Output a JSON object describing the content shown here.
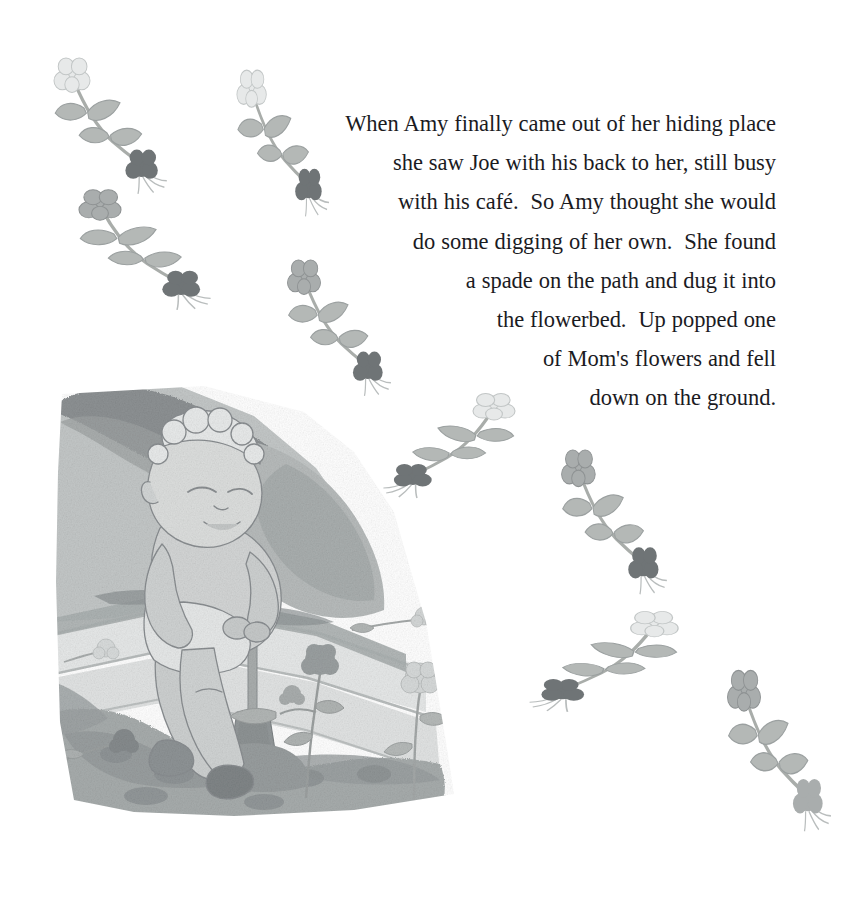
{
  "page": {
    "kind": "childrens-picture-book-page",
    "background_color": "#ffffff",
    "width": 860,
    "height": 904
  },
  "story": {
    "alignment": "right",
    "text_color": "#1b1b1f",
    "full_text": "When Amy finally came out of her hiding place she saw Joe with his back to her, still busy with his café.  So Amy thought she would do some digging of her own.  She found a spade on the path and dug it into the flowerbed.  Up popped one of Mom's flowers and fell down on the ground.",
    "lines": [
      "When Amy finally came out of her hiding place",
      "she saw Joe with his back to her, still busy",
      "with his café.  So Amy thought she would",
      "do some digging of her own.  She found",
      "a spade on the path and dug it into",
      "the flowerbed.  Up popped one",
      "of Mom's flowers and fell",
      "down on the ground."
    ]
  },
  "illustration": {
    "title": "child-digging-in-flowerbed",
    "description": "Grayscale watercolor of a young curly-haired toddler leaning on a spade, digging in a garden flowerbed beside a stone path, with a hedge-topped bank behind.",
    "palette": {
      "hedge_dark": "#8e9293",
      "bank_mid": "#b9bdbd",
      "bank_light": "#cdd1d1",
      "path_light": "#e4e6e6",
      "path_edge": "#c6caca",
      "soil_dark": "#9aa0a0",
      "soil_mid": "#b0b5b5",
      "skin": "#d4d6d6",
      "outline": "#8a8d90",
      "spade_handle": "#a9adad",
      "spade_blade": "#9a9e9e"
    },
    "elements": [
      "hedge-bank",
      "stone-path",
      "flowerbed-soil",
      "child-figure",
      "spade",
      "garden-flower-dark",
      "garden-flower-light"
    ]
  },
  "sprigs": {
    "description": "Scattered uprooted flower sprigs: a pale pom-pom bloom at one end, a dark root clump with fine root hairs at the other, joined by an arcing stem with paired leaves.",
    "colors": {
      "bloom_light": "#e7e9e9",
      "bloom_mid": "#a9adad",
      "bloom_dark": "#7b8081",
      "stem": "#a9adaa",
      "leaf": "#b4b8b6",
      "root": "#6f7476",
      "root_hair": "#b9bdbd"
    },
    "items": [
      {
        "name": "sprig-top-left",
        "x": 48,
        "y": 56,
        "w": 120,
        "h": 130,
        "rot": 0,
        "flip": false,
        "bloom": "light",
        "tip": "dark"
      },
      {
        "name": "sprig-upper-left-mid",
        "x": 72,
        "y": 188,
        "w": 140,
        "h": 115,
        "rot": 0,
        "flip": false,
        "bloom": "mid",
        "tip": "dark"
      },
      {
        "name": "sprig-top-center",
        "x": 232,
        "y": 68,
        "w": 98,
        "h": 140,
        "rot": 0,
        "flip": false,
        "bloom": "light",
        "tip": "dark"
      },
      {
        "name": "sprig-center-upper",
        "x": 282,
        "y": 258,
        "w": 110,
        "h": 130,
        "rot": 0,
        "flip": false,
        "bloom": "mid",
        "tip": "dark"
      },
      {
        "name": "sprig-center",
        "x": 382,
        "y": 392,
        "w": 140,
        "h": 100,
        "rot": 0,
        "flip": true,
        "bloom": "light",
        "tip": "dark"
      },
      {
        "name": "sprig-right-upper",
        "x": 556,
        "y": 448,
        "w": 112,
        "h": 138,
        "rot": 0,
        "flip": false,
        "bloom": "mid",
        "tip": "dark"
      },
      {
        "name": "sprig-right-mid",
        "x": 528,
        "y": 610,
        "w": 158,
        "h": 96,
        "rot": 0,
        "flip": true,
        "bloom": "light",
        "tip": "dark"
      },
      {
        "name": "sprig-bottom-right",
        "x": 722,
        "y": 668,
        "w": 110,
        "h": 154,
        "rot": 0,
        "flip": false,
        "bloom": "mid",
        "tip": "mid"
      }
    ]
  }
}
